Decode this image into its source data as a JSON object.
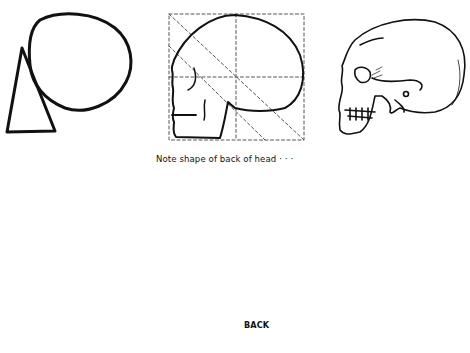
{
  "figure": {
    "caption_note": "Note shape of back of head · · ·",
    "label_back": "BACK",
    "panels": [
      {
        "id": "circle-triangle",
        "description": "Basic construction: oval cranium with triangular jaw mass"
      },
      {
        "id": "skull-profile-box",
        "description": "Simplified skull profile inside dotted construction square with diagonals"
      },
      {
        "id": "skull-profile-detailed",
        "description": "Detailed skull in profile"
      },
      {
        "id": "skull-front-box",
        "description": "Skull front view with dotted construction boxes"
      },
      {
        "id": "skull-back-box",
        "description": "Skull and neck vertebrae seen from behind in dotted construction box"
      },
      {
        "id": "head-muscles-profile",
        "description": "Head and neck muscles in profile, hatched drawing"
      }
    ],
    "colors": {
      "ink": "#111111",
      "paper": "#ffffff"
    }
  }
}
